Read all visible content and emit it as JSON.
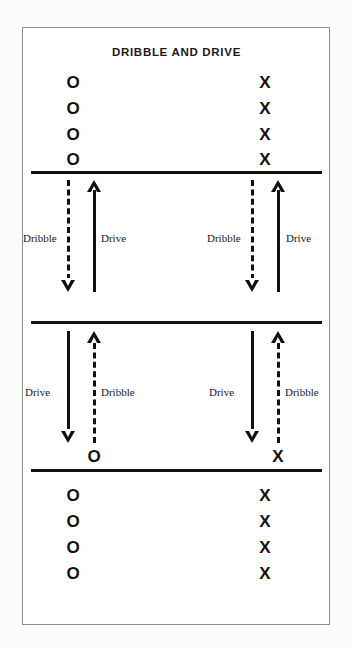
{
  "diagram": {
    "title": "DRIBBLE AND DRIVE",
    "colors": {
      "ink": "#111111",
      "frame": "#8e8e8e",
      "background": "#ffffff"
    },
    "court_lines": [
      {
        "name": "top-baseline"
      },
      {
        "name": "middle-line"
      },
      {
        "name": "bottom-baseline"
      }
    ],
    "players": {
      "o_symbol": "O",
      "x_symbol": "X",
      "top_o_count": 4,
      "top_x_count": 4,
      "bottom_o_count": 4,
      "bottom_x_count": 4,
      "mid_o_marker": "O",
      "mid_x_marker": "X"
    },
    "labels": {
      "dribble": "Dribble",
      "drive": "Drive"
    },
    "upper_section": {
      "left_group": {
        "dribble_label": "Dribble",
        "dribble_direction": "down",
        "drive_label": "Drive",
        "drive_direction": "up"
      },
      "right_group": {
        "dribble_label": "Dribble",
        "dribble_direction": "down",
        "drive_label": "Drive",
        "drive_direction": "up"
      }
    },
    "lower_section": {
      "left_group": {
        "drive_label": "Drive",
        "drive_direction": "down",
        "dribble_label": "Dribble",
        "dribble_direction": "up"
      },
      "right_group": {
        "drive_label": "Drive",
        "drive_direction": "down",
        "dribble_label": "Dribble",
        "dribble_direction": "up"
      }
    }
  }
}
